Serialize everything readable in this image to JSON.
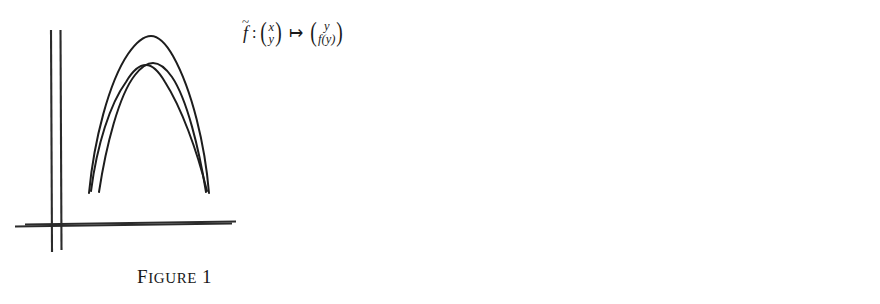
{
  "document": {
    "background_color": "#ffffff",
    "ink_color": "#1a1a1a",
    "width": 880,
    "height": 304
  },
  "figures": [
    {
      "id": "figure-1",
      "caption_first_letter": "F",
      "caption_rest": "igure",
      "caption_number": "1",
      "caption_full": "FIGURE 1",
      "formula": {
        "map_name": "f",
        "map_accent": "~",
        "colon": ":",
        "domain_top": "x",
        "domain_bottom": "y",
        "arrow": "↦",
        "codomain_top": "y",
        "codomain_bottom": "f(y)",
        "plain_text": "f̃ : (x, y) ↦ (y, f(y))"
      },
      "axes": {
        "vertical_x": 60,
        "vertical_top_y": 30,
        "vertical_bottom_y": 250,
        "horizontal_y": 223,
        "horizontal_left_x": 25,
        "horizontal_right_x": 236
      },
      "curves": [
        {
          "name": "arch",
          "peak_x": 152,
          "peak_y": 65,
          "left_end_x": 99,
          "left_end_y": 192,
          "right_end_x": 206,
          "right_end_y": 192
        }
      ]
    },
    {
      "id": "figure-2",
      "caption_first_letter": "F",
      "caption_rest": "igure",
      "caption_number": "2",
      "caption_full": "FIGURE 2",
      "formula": {
        "map_name": "F",
        "map_accent": "",
        "colon": ":",
        "domain_top": "x",
        "domain_bottom": "y",
        "arrow": "↦",
        "codomain_top": "y",
        "codomain_bottom": "εx+f(y)",
        "plain_text": "F : (x, y) ↦ (y, εx+f(y))"
      },
      "axes": {
        "vertical_x": 491,
        "vertical_top_y": 30,
        "vertical_bottom_y": 252,
        "horizontal_y": 225,
        "horizontal_left_x": 455,
        "horizontal_right_x": 672
      },
      "curves": [
        {
          "name": "outer-arch",
          "peak_x": 591,
          "peak_y": 37,
          "left_end_x": 529,
          "left_end_y": 193,
          "right_end_x": 649,
          "right_end_y": 193
        },
        {
          "name": "inner-arch",
          "peak_x": 585,
          "peak_y": 66,
          "left_end_x": 531,
          "left_end_y": 191,
          "right_end_x": 647,
          "right_end_y": 191
        }
      ]
    }
  ]
}
